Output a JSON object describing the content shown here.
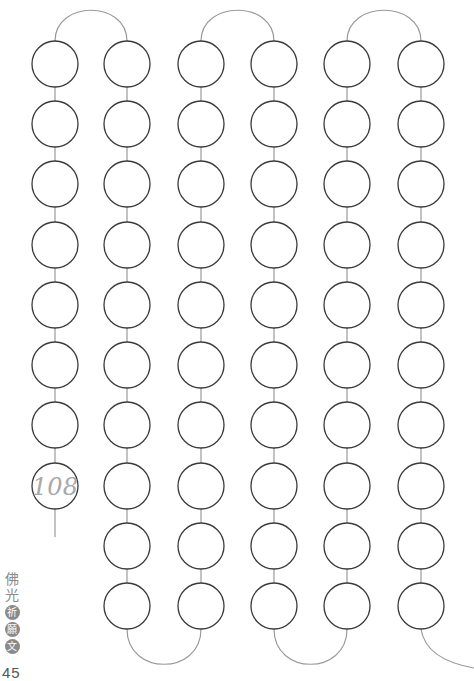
{
  "page": {
    "title_vertical": {
      "plain_chars": [
        "佛",
        "光"
      ],
      "circled_chars": [
        "祈",
        "願",
        "文"
      ]
    },
    "page_number": "45",
    "count_label": "108"
  },
  "layout": {
    "columns_x": [
      55,
      127,
      201,
      274,
      347,
      421
    ],
    "rows_y": [
      64,
      124,
      184,
      245,
      305,
      365,
      425,
      486,
      546,
      606
    ],
    "bead_radius": 23,
    "column_bead_counts": [
      8,
      10,
      10,
      10,
      10,
      10
    ],
    "top_arches": [
      [
        0,
        1
      ],
      [
        2,
        3
      ],
      [
        4,
        5
      ]
    ],
    "bottom_arches": [
      [
        1,
        2
      ],
      [
        3,
        4
      ]
    ],
    "colors": {
      "bead_stroke": "#3a3a3a",
      "link": "#9a9a9a",
      "label": "#a8a8a8"
    }
  }
}
